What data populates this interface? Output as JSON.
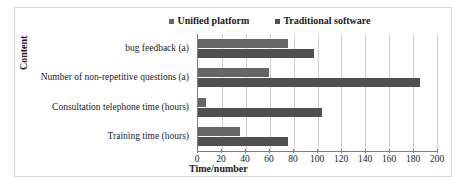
{
  "chart_data": {
    "type": "bar",
    "orientation": "horizontal",
    "title": "",
    "xlabel": "Time/number",
    "ylabel": "Content",
    "categories": [
      "bug feedback (a)",
      "Number of non-repetitive questions (a)",
      "Consultation telephone time (hours)",
      "Training time (hours)"
    ],
    "series": [
      {
        "name": "Unified platform",
        "color": "#666666",
        "values": [
          75,
          59,
          7,
          35
        ]
      },
      {
        "name": "Traditional software",
        "color": "#4f4f4f",
        "values": [
          97,
          186,
          104,
          75
        ]
      }
    ],
    "xlim": [
      0,
      200
    ],
    "xticks": [
      0,
      20,
      40,
      60,
      80,
      100,
      120,
      140,
      160,
      180,
      200
    ],
    "grid": "vertical",
    "legend_position": "top-center"
  },
  "legend": {
    "entries": [
      {
        "label": "Unified platform"
      },
      {
        "label": "Traditional software"
      }
    ]
  },
  "axes": {
    "x_title": "Time/number",
    "y_title": "Content"
  }
}
